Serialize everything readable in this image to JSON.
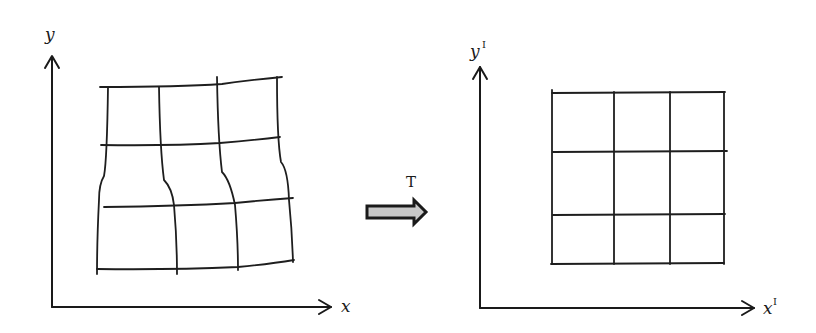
{
  "figure": {
    "left_panel": {
      "y_label": "y",
      "x_label": "x",
      "grid_description": "distorted 3x3 grid"
    },
    "transform": {
      "label": "T",
      "arrow_fill": "#c8c8c8",
      "arrow_stroke": "#1a1a1a"
    },
    "right_panel": {
      "y_label": "y",
      "y_sup": "I",
      "x_label": "x",
      "x_sup": "I",
      "grid_description": "regular 3x3 grid"
    },
    "colors": {
      "ink": "#1a1a1a",
      "background": "#ffffff"
    }
  }
}
